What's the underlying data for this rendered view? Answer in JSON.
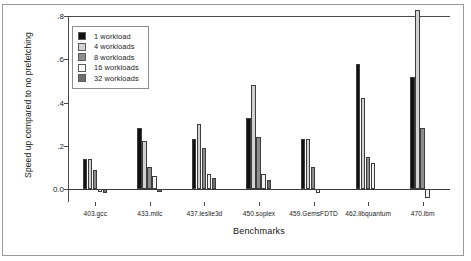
{
  "chart_data": {
    "type": "bar",
    "title": "",
    "xlabel": "Benchmarks",
    "ylabel": "Speed up compared to no prefetching",
    "ylim": [
      -0.06,
      0.8
    ],
    "yticks": [
      0.0,
      0.2,
      0.4,
      0.6,
      0.8
    ],
    "ytick_labels": [
      "0.0",
      ".2",
      ".4",
      ".6",
      ".8"
    ],
    "grid": false,
    "legend_position": "upper-left-inside",
    "categories": [
      "403.gcc",
      "433.milc",
      "437.leslie3d",
      "450.soplex",
      "459.GemsFDTD",
      "462.libquantum",
      "470.lbm"
    ],
    "series": [
      {
        "name": "1 workload",
        "color": "#101010",
        "values": [
          0.14,
          0.28,
          0.23,
          0.33,
          0.23,
          0.58,
          0.52
        ]
      },
      {
        "name": "4 workloads",
        "color": "#d2d2d2",
        "values": [
          0.14,
          0.22,
          0.3,
          0.48,
          0.23,
          0.42,
          0.86
        ]
      },
      {
        "name": "8 workloads",
        "color": "#8c8c8c",
        "values": [
          0.09,
          0.1,
          0.19,
          0.24,
          0.1,
          0.15,
          0.28
        ]
      },
      {
        "name": "16 workloads",
        "color": "#f2f2f2",
        "values": [
          -0.015,
          0.06,
          0.07,
          0.07,
          -0.02,
          0.12,
          -0.04
        ]
      },
      {
        "name": "32 workloads",
        "color": "#6e6e6e",
        "values": [
          -0.02,
          -0.015,
          0.05,
          0.04,
          0.0,
          0.0,
          0.0
        ]
      }
    ],
    "notes": {
      "clipped_bar": "470.lbm / 4 workloads extends above the .8 axis top"
    }
  },
  "legend": {
    "items": [
      {
        "label": "1 workload",
        "color": "#101010"
      },
      {
        "label": "4 workloads",
        "color": "#d2d2d2"
      },
      {
        "label": "8 workloads",
        "color": "#8c8c8c"
      },
      {
        "label": "16 workloads",
        "color": "#f8f8f8"
      },
      {
        "label": "32 workloads",
        "color": "#6e6e6e"
      }
    ]
  }
}
